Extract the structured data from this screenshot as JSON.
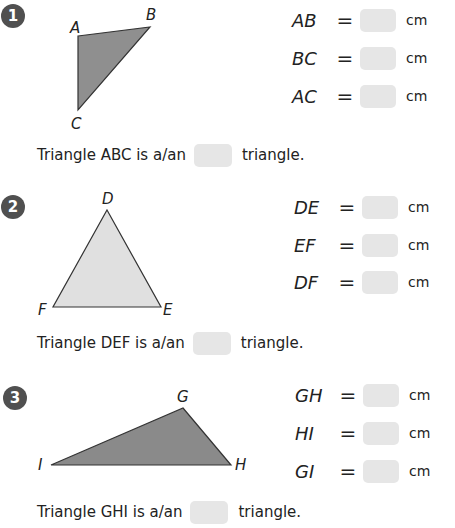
{
  "problems": [
    {
      "number": "1",
      "vertices": {
        "A": "A",
        "B": "B",
        "C": "C"
      },
      "fill": "#8f8f8f",
      "measurements": [
        {
          "segment": "AB",
          "equals": "=",
          "value": "",
          "unit": "cm"
        },
        {
          "segment": "BC",
          "equals": "=",
          "value": "",
          "unit": "cm"
        },
        {
          "segment": "AC",
          "equals": "=",
          "value": "",
          "unit": "cm"
        }
      ],
      "sentence": {
        "prefix": "Triangle ABC is a/an",
        "answer": "",
        "suffix": "triangle."
      }
    },
    {
      "number": "2",
      "vertices": {
        "D": "D",
        "E": "E",
        "F": "F"
      },
      "fill": "#e0e0e0",
      "measurements": [
        {
          "segment": "DE",
          "equals": "=",
          "value": "",
          "unit": "cm"
        },
        {
          "segment": "EF",
          "equals": "=",
          "value": "",
          "unit": "cm"
        },
        {
          "segment": "DF",
          "equals": "=",
          "value": "",
          "unit": "cm"
        }
      ],
      "sentence": {
        "prefix": "Triangle DEF is a/an",
        "answer": "",
        "suffix": "triangle."
      }
    },
    {
      "number": "3",
      "vertices": {
        "G": "G",
        "H": "H",
        "I": "I"
      },
      "fill": "#8a8a8a",
      "measurements": [
        {
          "segment": "GH",
          "equals": "=",
          "value": "",
          "unit": "cm"
        },
        {
          "segment": "HI",
          "equals": "=",
          "value": "",
          "unit": "cm"
        },
        {
          "segment": "GI",
          "equals": "=",
          "value": "",
          "unit": "cm"
        }
      ],
      "sentence": {
        "prefix": "Triangle GHI is a/an",
        "answer": "",
        "suffix": "triangle."
      }
    }
  ]
}
